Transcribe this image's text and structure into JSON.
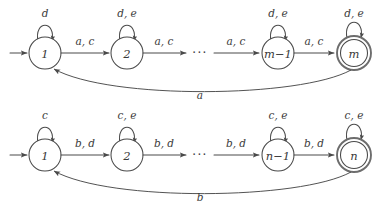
{
  "figure": {
    "type": "finite-automata-pair",
    "background_color": "#ffffff",
    "stroke_color": "#4a4a4a",
    "accept_ring_color": "#6d6d6d",
    "text_color": "#3a3a3a",
    "ellipsis": "···"
  },
  "machines": [
    {
      "id": "top-automaton",
      "row": 1,
      "start_arrow": true,
      "states": [
        {
          "id": "m-q1",
          "label": "1",
          "accepting": false,
          "self_loop_label": "d"
        },
        {
          "id": "m-q2",
          "label": "2",
          "accepting": false,
          "self_loop_label": "d, e"
        },
        {
          "id": "m-qm-1",
          "label": "m−1",
          "accepting": false,
          "self_loop_label": "d, e"
        },
        {
          "id": "m-qm",
          "label": "m",
          "accepting": true,
          "self_loop_label": "d, e"
        }
      ],
      "transitions": [
        {
          "id": "m-t1",
          "from": "m-q1",
          "to": "m-q2",
          "label": "a, c"
        },
        {
          "id": "m-t2",
          "from": "m-q2",
          "to": "ellipsis",
          "label": "a, c"
        },
        {
          "id": "m-t3",
          "from": "ellipsis",
          "to": "m-qm-1",
          "label": "a, c"
        },
        {
          "id": "m-t4",
          "from": "m-qm-1",
          "to": "m-qm",
          "label": "a, c"
        }
      ],
      "return_edge": {
        "id": "m-return",
        "from": "m-qm",
        "to": "m-q1",
        "label": "a"
      }
    },
    {
      "id": "bottom-automaton",
      "row": 2,
      "start_arrow": true,
      "states": [
        {
          "id": "n-q1",
          "label": "1",
          "accepting": false,
          "self_loop_label": "c"
        },
        {
          "id": "n-q2",
          "label": "2",
          "accepting": false,
          "self_loop_label": "c, e"
        },
        {
          "id": "n-qn-1",
          "label": "n−1",
          "accepting": false,
          "self_loop_label": "c, e"
        },
        {
          "id": "n-qn",
          "label": "n",
          "accepting": true,
          "self_loop_label": "c, e"
        }
      ],
      "transitions": [
        {
          "id": "n-t1",
          "from": "n-q1",
          "to": "n-q2",
          "label": "b, d"
        },
        {
          "id": "n-t2",
          "from": "n-q2",
          "to": "ellipsis",
          "label": "b, d"
        },
        {
          "id": "n-t3",
          "from": "ellipsis",
          "to": "n-qn-1",
          "label": "b, d"
        },
        {
          "id": "n-t4",
          "from": "n-qn-1",
          "to": "n-qn",
          "label": "b, d"
        }
      ],
      "return_edge": {
        "id": "n-return",
        "from": "n-qn",
        "to": "n-q1",
        "label": "b"
      }
    }
  ]
}
